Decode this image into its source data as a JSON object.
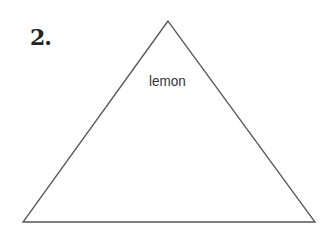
{
  "problem": {
    "number": "2.",
    "shape": "triangle",
    "label": "lemon"
  },
  "colors": {
    "stroke": "#555555",
    "text": "#333333",
    "background": "#ffffff"
  }
}
